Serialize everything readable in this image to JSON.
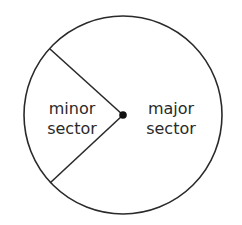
{
  "diagram": {
    "type": "circle-sectors",
    "center": {
      "x": 123,
      "y": 115
    },
    "radius": 99,
    "radius_endpoints": [
      {
        "x": 50,
        "y": 49
      },
      {
        "x": 50,
        "y": 183
      }
    ],
    "stroke_color": "#2a2a2a",
    "labels": {
      "minor": {
        "line1": "minor",
        "line2": "sector"
      },
      "major": {
        "line1": "major",
        "line2": "sector"
      }
    }
  }
}
